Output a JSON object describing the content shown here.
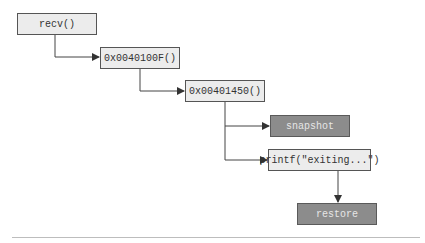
{
  "diagram": {
    "nodes": [
      {
        "id": "recv",
        "label": "recv()",
        "style": "light"
      },
      {
        "id": "fn_100F",
        "label": "0x0040100F()",
        "style": "light"
      },
      {
        "id": "fn_1450",
        "label": "0x00401450()",
        "style": "light"
      },
      {
        "id": "snapshot",
        "label": "snapshot",
        "style": "dark"
      },
      {
        "id": "printf",
        "label": "printf(\"exiting...\")",
        "style": "light"
      },
      {
        "id": "restore",
        "label": "restore",
        "style": "dark"
      }
    ],
    "edges": [
      {
        "from": "recv",
        "to": "fn_100F"
      },
      {
        "from": "fn_100F",
        "to": "fn_1450"
      },
      {
        "from": "fn_1450",
        "to": "snapshot"
      },
      {
        "from": "fn_1450",
        "to": "printf"
      },
      {
        "from": "printf",
        "to": "restore"
      }
    ],
    "colors": {
      "light_box": "#ececec",
      "dark_box": "#8c8c8c",
      "border": "#555555",
      "line": "#333333"
    }
  }
}
